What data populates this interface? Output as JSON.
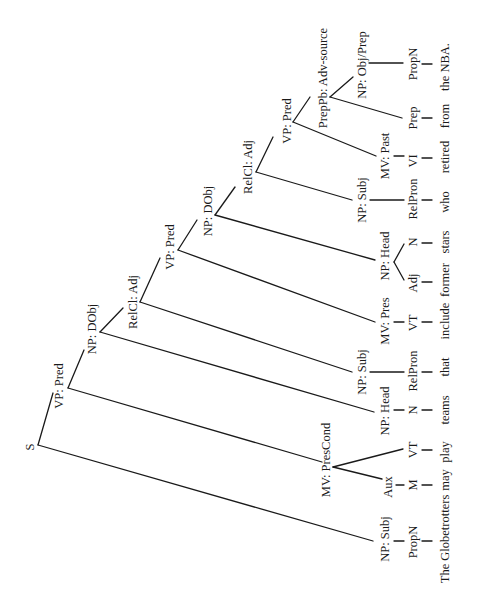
{
  "diagram": {
    "type": "syntax-tree",
    "orientation": "rotated-90-ccw",
    "sentence": "The Globetrotters may play teams that include former stars who retired from the NBA.",
    "nodes": {
      "s": "S",
      "vp1": "VP: Pred",
      "np_dobj1": "NP: DObj",
      "relcl1": "RelCl: Adj",
      "vp2": "VP: Pred",
      "np_dobj2": "NP: DObj",
      "relcl2": "RelCl: Adj",
      "vp3": "VP: Pred",
      "prepph": "PrepPb: Adv-source",
      "np_objprep": "NP: Obj/Prep",
      "np_subj0": "NP: Subj",
      "mv_prescond": "MV: PresCond",
      "np_head1": "NP: Head",
      "np_subj1": "NP: Subj",
      "mv_pres": "MV: Pres",
      "np_head2": "NP: Head",
      "np_subj2": "NP: Subj",
      "mv_past": "MV: Past"
    },
    "pos": {
      "propn0": "PropN",
      "aux": "Aux",
      "m": "M",
      "vt_play": "VT",
      "n_teams": "N",
      "relpron1": "RelPron",
      "vt_include": "VT",
      "adj": "Adj",
      "n_stars": "N",
      "relpron2": "RelPron",
      "vi": "VI",
      "prep": "Prep",
      "propn_nba": "PropN"
    },
    "words": {
      "globetrotters": "The Globetrotters",
      "may": "may",
      "play": "play",
      "teams": "teams",
      "that": "that",
      "include": "include",
      "former": "former",
      "stars": "stars",
      "who": "who",
      "retired": "retired",
      "from": "from",
      "nba": "the NBA."
    }
  }
}
